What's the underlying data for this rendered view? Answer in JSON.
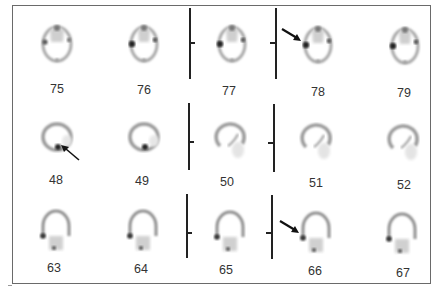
{
  "figure": {
    "type": "SPECT brain slices montage",
    "rows": [
      {
        "orientation": "transaxial",
        "slices": [
          {
            "label": "75",
            "arrow": false
          },
          {
            "label": "76",
            "arrow": false
          },
          {
            "label": "77",
            "arrow": false
          },
          {
            "label": "78",
            "arrow": true
          },
          {
            "label": "79",
            "arrow": false
          }
        ]
      },
      {
        "orientation": "sagittal",
        "slices": [
          {
            "label": "48",
            "arrow": true
          },
          {
            "label": "49",
            "arrow": false
          },
          {
            "label": "50",
            "arrow": false
          },
          {
            "label": "51",
            "arrow": false
          },
          {
            "label": "52",
            "arrow": false
          }
        ]
      },
      {
        "orientation": "coronal",
        "slices": [
          {
            "label": "63",
            "arrow": false
          },
          {
            "label": "64",
            "arrow": false
          },
          {
            "label": "65",
            "arrow": false
          },
          {
            "label": "66",
            "arrow": true
          },
          {
            "label": "67",
            "arrow": false
          }
        ]
      }
    ],
    "colors": {
      "frame": "#6a6a6a",
      "divider": "#222222",
      "label": "#333333",
      "uptake_low": "#d8d8d8",
      "uptake_high": "#111111"
    }
  }
}
